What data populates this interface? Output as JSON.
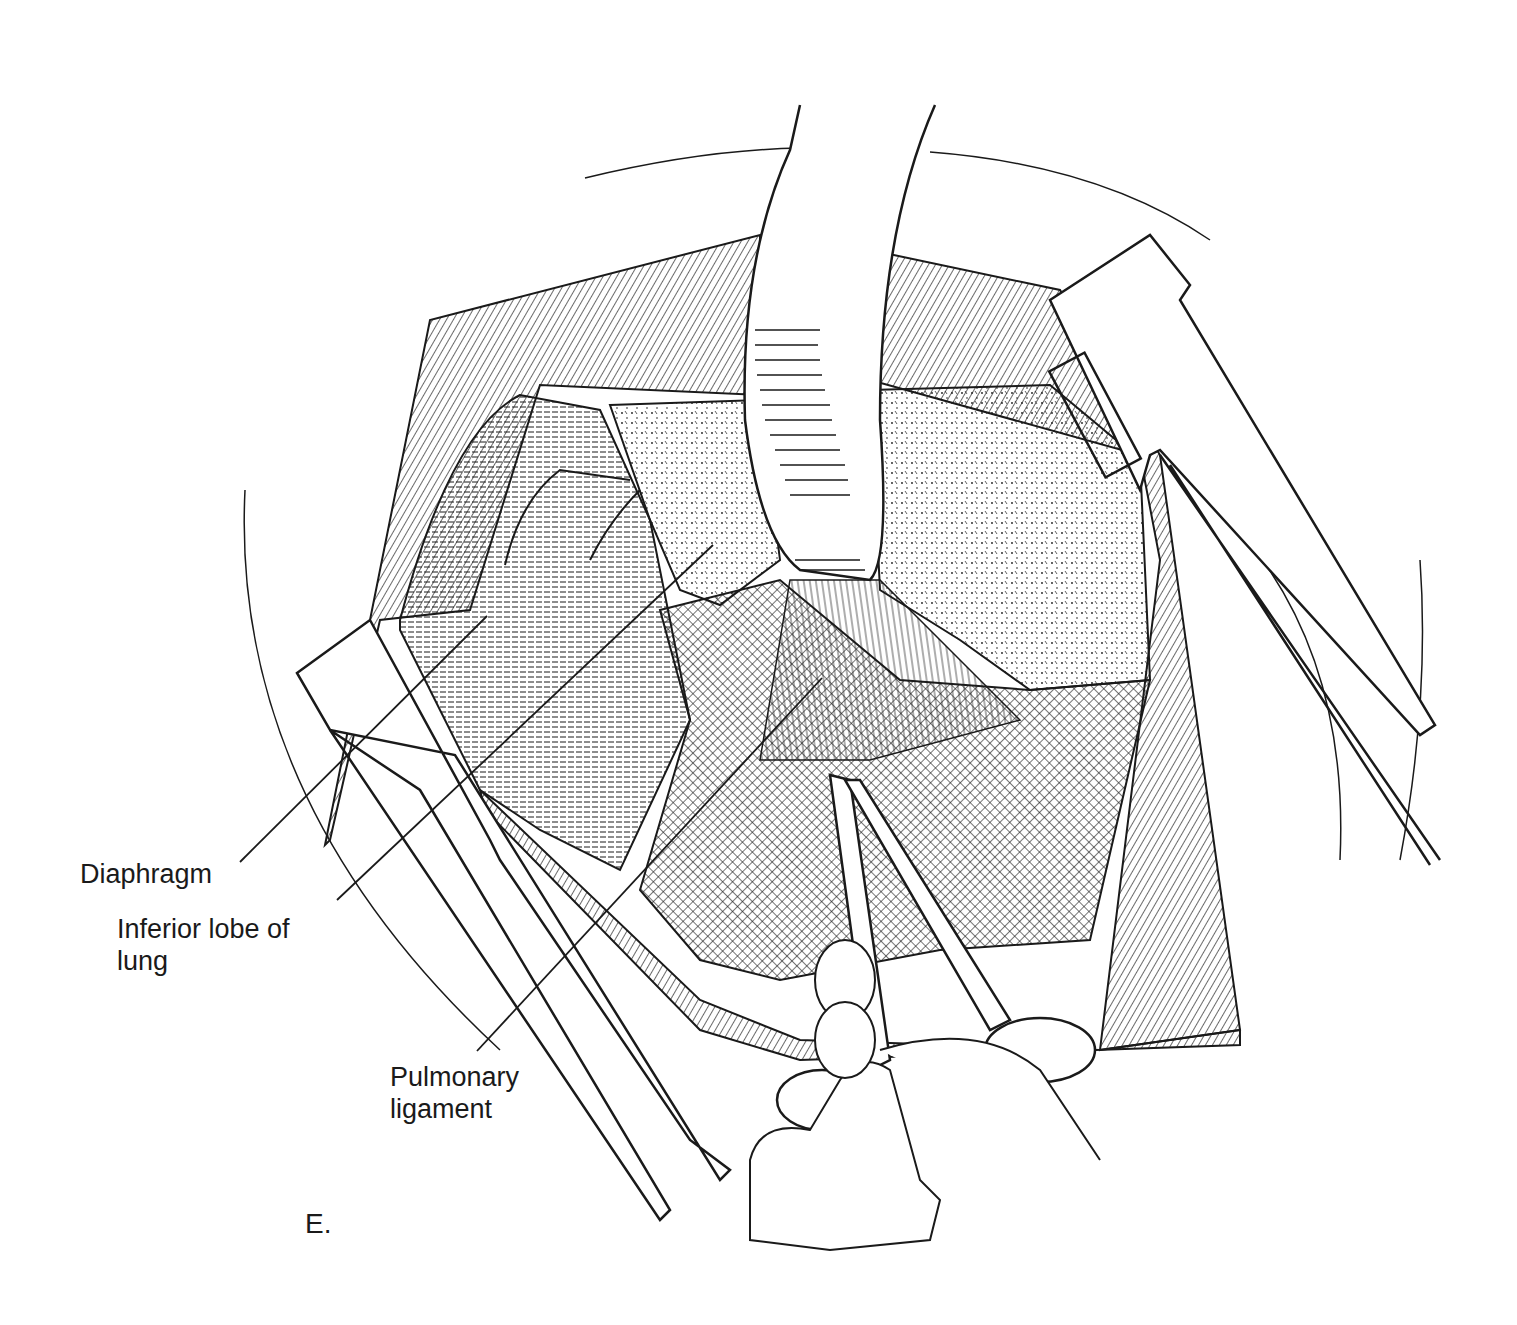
{
  "figure": {
    "panel_label": "E.",
    "colors": {
      "ink": "#1a1a1a",
      "background": "#ffffff"
    }
  },
  "labels": [
    {
      "id": "diaphragm",
      "text": "Diaphragm",
      "pointer_from": [
        240,
        862
      ],
      "pointer_to": [
        487,
        616
      ]
    },
    {
      "id": "inferior-lobe",
      "text": "Inferior lobe of\nlung",
      "pointer_from": [
        337,
        900
      ],
      "pointer_to": [
        713,
        545
      ]
    },
    {
      "id": "pulmonary-ligament",
      "text": "Pulmonary\nligament",
      "pointer_from": [
        477,
        1051
      ],
      "pointer_to": [
        822,
        678
      ]
    }
  ],
  "icons": {
    "rib-retractor-left": "retractor-blade",
    "rib-retractor-right": "retractor-blade",
    "lung-retractor": "malleable-retractor",
    "scissors": "metzenbaum-scissors",
    "hand": "surgeon-hand"
  }
}
